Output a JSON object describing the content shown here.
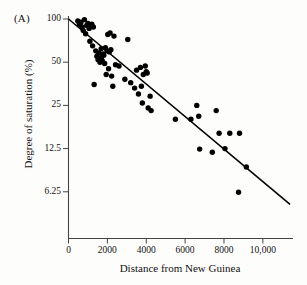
{
  "panel": {
    "label": "(A)"
  },
  "chart_data": {
    "type": "scatter",
    "title": "",
    "xlabel": "Distance from New Guinea",
    "ylabel": "Degree of saturation (%)",
    "xlim": [
      0,
      11500
    ],
    "ylim": [
      5,
      100
    ],
    "yscale": "log2",
    "grid": false,
    "legend": null,
    "xticks": [
      0,
      2000,
      4000,
      6000,
      8000,
      10000
    ],
    "xticklabels": [
      "0",
      "2000",
      "4000",
      "6000",
      "8000",
      "10,000"
    ],
    "yticks": [
      100,
      50,
      25,
      12.5,
      6.25
    ],
    "yticklabels": [
      "100",
      "50",
      "25",
      "12.5",
      "6.25"
    ],
    "series": [
      {
        "name": "islands",
        "marker": "filled-circle",
        "color": "#000000",
        "points": [
          [
            480,
            97
          ],
          [
            560,
            92
          ],
          [
            640,
            95
          ],
          [
            700,
            88
          ],
          [
            760,
            83
          ],
          [
            820,
            99
          ],
          [
            880,
            79
          ],
          [
            940,
            90
          ],
          [
            1000,
            93
          ],
          [
            1060,
            86
          ],
          [
            1100,
            70
          ],
          [
            1150,
            91
          ],
          [
            1200,
            92
          ],
          [
            1240,
            65
          ],
          [
            1280,
            88
          ],
          [
            1320,
            35
          ],
          [
            1400,
            60
          ],
          [
            1460,
            55
          ],
          [
            1520,
            52
          ],
          [
            1560,
            58
          ],
          [
            1620,
            50
          ],
          [
            1680,
            62
          ],
          [
            1700,
            54
          ],
          [
            1740,
            51
          ],
          [
            1780,
            57
          ],
          [
            1820,
            56
          ],
          [
            1860,
            49
          ],
          [
            1900,
            63
          ],
          [
            1940,
            41
          ],
          [
            1980,
            60
          ],
          [
            2020,
            78
          ],
          [
            2060,
            45
          ],
          [
            2100,
            59
          ],
          [
            2140,
            80
          ],
          [
            2180,
            61
          ],
          [
            2220,
            40
          ],
          [
            2280,
            34
          ],
          [
            2340,
            76
          ],
          [
            2420,
            48
          ],
          [
            2600,
            47
          ],
          [
            2900,
            38
          ],
          [
            3050,
            72
          ],
          [
            3200,
            36
          ],
          [
            3400,
            33
          ],
          [
            3500,
            44
          ],
          [
            3600,
            30
          ],
          [
            3700,
            46
          ],
          [
            3750,
            34
          ],
          [
            3800,
            26
          ],
          [
            3850,
            41
          ],
          [
            3950,
            47
          ],
          [
            4000,
            43
          ],
          [
            4050,
            42
          ],
          [
            4100,
            24
          ],
          [
            4200,
            29
          ],
          [
            4250,
            23
          ],
          [
            5500,
            20
          ],
          [
            6300,
            20
          ],
          [
            6600,
            25
          ],
          [
            6700,
            21
          ],
          [
            6750,
            12.4
          ],
          [
            7400,
            11.8
          ],
          [
            7600,
            23
          ],
          [
            7750,
            16
          ],
          [
            8050,
            12.5
          ],
          [
            8300,
            16
          ],
          [
            8750,
            6.2
          ],
          [
            8800,
            16
          ],
          [
            9150,
            9.3
          ]
        ]
      }
    ],
    "fit_line": {
      "type": "linear-regression-on-log",
      "x_start": 0,
      "y_start": 100,
      "x_end": 11400,
      "y_end": 5.1
    }
  }
}
